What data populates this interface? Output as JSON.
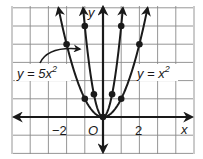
{
  "chart_data": {
    "type": "line",
    "title": "",
    "xlabel": "x",
    "ylabel": "y",
    "origin_label": "O",
    "xlim": [
      -5,
      5
    ],
    "ylim": [
      -2,
      6
    ],
    "grid": true,
    "x_tick_labels": [
      {
        "value": -2,
        "label": "−2"
      },
      {
        "value": 2,
        "label": "2"
      }
    ],
    "series": [
      {
        "name": "y = 5x²",
        "label_text": "y = 5x",
        "label_sup": "2",
        "equation": "5*x^2",
        "points": [
          {
            "x": -1,
            "y": 5
          },
          {
            "x": -0.5,
            "y": 1.25
          },
          {
            "x": 0,
            "y": 0
          },
          {
            "x": 0.5,
            "y": 1.25
          },
          {
            "x": 1,
            "y": 5
          }
        ]
      },
      {
        "name": "y = x²",
        "label_text": "y = x",
        "label_sup": "2",
        "equation": "x^2",
        "points": [
          {
            "x": -2,
            "y": 4
          },
          {
            "x": -1,
            "y": 1
          },
          {
            "x": 0,
            "y": 0
          },
          {
            "x": 1,
            "y": 1
          },
          {
            "x": 2,
            "y": 4
          }
        ]
      }
    ],
    "colors": {
      "curve": "#1a1a1a",
      "grid": "#8a8a8a",
      "axis": "#1a1a1a"
    }
  }
}
